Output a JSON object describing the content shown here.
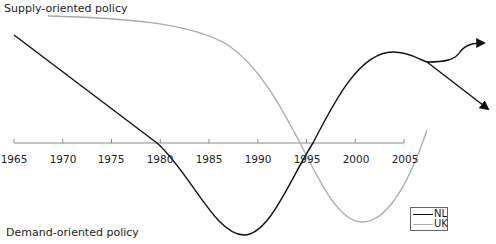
{
  "chart_data": {
    "type": "line",
    "title": "",
    "y_top_label": "Supply-oriented policy",
    "y_bottom_label": "Demand-oriented policy",
    "xlabel": "",
    "ylabel": "",
    "x_ticks": [
      "1965",
      "1970",
      "1975",
      "1980",
      "1985",
      "1990",
      "1995",
      "2000",
      "2005"
    ],
    "xlim": [
      1965,
      2012
    ],
    "ylim": [
      -1,
      1
    ],
    "grid": false,
    "legend_position": "bottom-right",
    "series": [
      {
        "name": "NL",
        "color": "#111111",
        "points": [
          [
            1965,
            0.78
          ],
          [
            1970,
            0.55
          ],
          [
            1975,
            0.32
          ],
          [
            1980,
            0.0
          ],
          [
            1985,
            -0.55
          ],
          [
            1988.5,
            -0.98
          ],
          [
            1992,
            -0.6
          ],
          [
            1996,
            0.0
          ],
          [
            2000,
            0.6
          ],
          [
            2003,
            0.94
          ],
          [
            2006,
            0.85
          ],
          [
            2007.5,
            0.8
          ]
        ],
        "projections": [
          {
            "label": "upper branch",
            "points": [
              [
                2007.5,
                0.8
              ],
              [
                2010,
                0.85
              ],
              [
                2012,
                0.98
              ]
            ]
          },
          {
            "label": "lower branch",
            "points": [
              [
                2007.5,
                0.8
              ],
              [
                2010,
                0.55
              ],
              [
                2012,
                0.33
              ]
            ]
          }
        ]
      },
      {
        "name": "UK",
        "color": "#aaaaaa",
        "points": [
          [
            1968.5,
            0.98
          ],
          [
            1975,
            0.96
          ],
          [
            1980,
            0.92
          ],
          [
            1985,
            0.8
          ],
          [
            1990,
            0.55
          ],
          [
            1993,
            0.2
          ],
          [
            1995,
            0.0
          ],
          [
            1998,
            -0.6
          ],
          [
            2000,
            -0.85
          ],
          [
            2002,
            -0.75
          ],
          [
            2005,
            -0.3
          ],
          [
            2007.5,
            0.1
          ]
        ]
      }
    ]
  },
  "labels": {
    "supply": "Supply-oriented policy",
    "demand": "Demand-oriented policy"
  },
  "axis": {
    "ticks": [
      "1965",
      "1970",
      "1975",
      "1980",
      "1985",
      "1990",
      "1995",
      "2000",
      "2005"
    ]
  },
  "legend": {
    "items": [
      {
        "label": "NL",
        "color": "#111111"
      },
      {
        "label": "UK",
        "color": "#aaaaaa"
      }
    ]
  }
}
